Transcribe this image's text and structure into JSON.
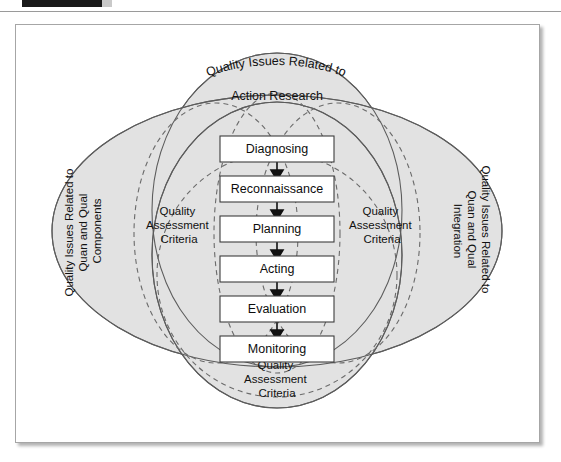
{
  "header": {
    "tab_label": "",
    "right_label": "",
    "tab_color": "#1a1a1a",
    "accent_color": "#c9c9c9"
  },
  "figure": {
    "background": "#ffffff",
    "border_color": "#a6a6a6",
    "venn_fill": "#e2e2e2",
    "venn_stroke": "#5c5c5c",
    "dashed_stroke": "#6b6b6b",
    "box_fill": "#ffffff",
    "box_stroke": "#3d3d3d",
    "arrow_color": "#111111"
  },
  "venn": {
    "top": {
      "curved_line": "Quality Issues Related to",
      "straight_line": "Action Research"
    },
    "left": {
      "line1": "Quality Issues Related to",
      "line2": "Quan and Qual",
      "line3": "Components"
    },
    "right": {
      "line1": "Quality Issues Related to",
      "line2": "Quan and Qual",
      "line3": "Integration"
    }
  },
  "criteria": {
    "left": {
      "line1": "Quality",
      "line2": "Assessment",
      "line3": "Criteria"
    },
    "right": {
      "line1": "Quality",
      "line2": "Assessment",
      "line3": "Criteria"
    },
    "bottom": {
      "line1": "Quality",
      "line2": "Assessment",
      "line3": "Criteria"
    }
  },
  "cycle": {
    "steps": [
      {
        "label": "Diagnosing"
      },
      {
        "label": "Reconnaissance"
      },
      {
        "label": "Planning"
      },
      {
        "label": "Acting"
      },
      {
        "label": "Evaluation"
      },
      {
        "label": "Monitoring"
      }
    ]
  }
}
